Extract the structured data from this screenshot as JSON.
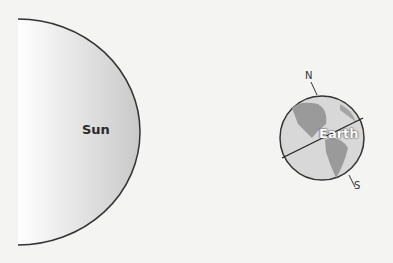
{
  "diagram": {
    "sun": {
      "label": "Sun"
    },
    "earth": {
      "label": "Earth",
      "north_label": "N",
      "south_label": "S"
    }
  }
}
